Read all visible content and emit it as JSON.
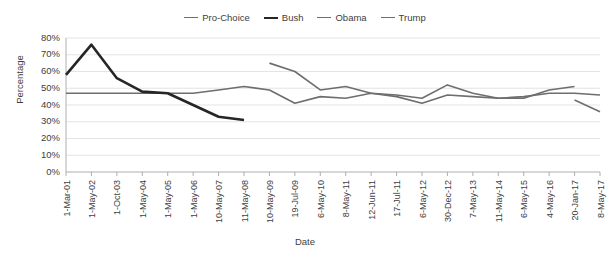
{
  "chart_data": {
    "type": "line",
    "title": "",
    "xlabel": "Date",
    "ylabel": "Percentage",
    "ylim": [
      0,
      80
    ],
    "ytick_labels": [
      "0%",
      "10%",
      "20%",
      "30%",
      "40%",
      "50%",
      "60%",
      "70%",
      "80%"
    ],
    "ytick_values": [
      0,
      10,
      20,
      30,
      40,
      50,
      60,
      70,
      80
    ],
    "grid": true,
    "legend_position": "top-center",
    "categories": [
      "1-Mar-01",
      "1-May-02",
      "1-Oct-03",
      "1-May-04",
      "1-May-05",
      "1-May-06",
      "10-May-07",
      "11-May-08",
      "10-May-09",
      "19-Jul-09",
      "6-May-10",
      "8-May-11",
      "12-Jun-11",
      "17-Jul-11",
      "6-May-12",
      "30-Dec-12",
      "7-May-13",
      "11-May-14",
      "6-May-15",
      "4-May-16",
      "20-Jan-17",
      "8-May-17"
    ],
    "series": [
      {
        "name": "Pro-Choice",
        "color": "#6e6e6e",
        "width": 1.6,
        "values": [
          47,
          47,
          47,
          47,
          47,
          47,
          49,
          51,
          49,
          41,
          45,
          44,
          47,
          45,
          41,
          46,
          45,
          44,
          45,
          47,
          47,
          46
        ]
      },
      {
        "name": "Bush",
        "color": "#262626",
        "width": 2.6,
        "values": [
          58,
          76,
          56,
          48,
          47,
          40,
          33,
          31,
          null,
          null,
          null,
          null,
          null,
          null,
          null,
          null,
          null,
          null,
          null,
          null,
          null,
          null
        ]
      },
      {
        "name": "Obama",
        "color": "#6e6e6e",
        "width": 1.6,
        "values": [
          null,
          null,
          null,
          null,
          null,
          null,
          null,
          null,
          65,
          60,
          49,
          51,
          47,
          46,
          44,
          52,
          47,
          44,
          44,
          49,
          51,
          null
        ]
      },
      {
        "name": "Trump",
        "color": "#6e6e6e",
        "width": 1.6,
        "values": [
          null,
          null,
          null,
          null,
          null,
          null,
          null,
          null,
          null,
          null,
          null,
          null,
          null,
          null,
          null,
          null,
          null,
          null,
          null,
          null,
          43,
          36
        ]
      }
    ]
  },
  "legend": {
    "entries": [
      {
        "label": "Pro-Choice"
      },
      {
        "label": "Bush"
      },
      {
        "label": "Obama"
      },
      {
        "label": "Trump"
      }
    ]
  },
  "axes": {
    "y_title": "Percentage",
    "x_title": "Date"
  }
}
